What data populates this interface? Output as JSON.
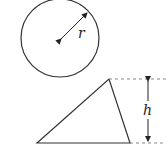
{
  "circle": {
    "radius_label": "r",
    "stroke": "#333333"
  },
  "triangle": {
    "height_label": "h",
    "stroke": "#333333"
  },
  "dash_color": "#888888"
}
